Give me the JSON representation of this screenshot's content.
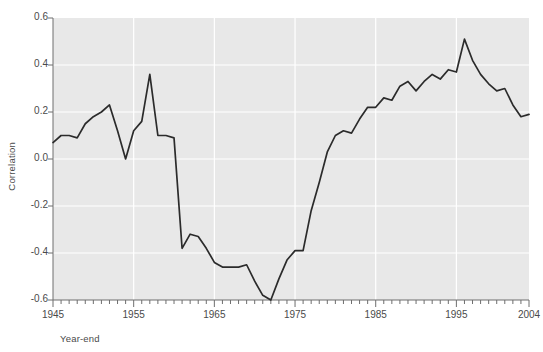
{
  "chart_data": {
    "type": "line",
    "title": "",
    "xlabel": "Year-end",
    "ylabel": "Correlation",
    "xlim": [
      1945,
      2004
    ],
    "ylim": [
      -0.6,
      0.6
    ],
    "grid": true,
    "legend": null,
    "x_tick_labels": [
      "1945",
      "1955",
      "1965",
      "1975",
      "1985",
      "1995",
      "2004"
    ],
    "x_tick_values": [
      1945,
      1955,
      1965,
      1975,
      1985,
      1995,
      2004
    ],
    "y_tick_labels": [
      "0.6",
      "0.4",
      "0.2",
      "0.0",
      "-0.2",
      "-0.4",
      "-0.6"
    ],
    "y_tick_values": [
      0.6,
      0.4,
      0.2,
      0.0,
      -0.2,
      -0.4,
      -0.6
    ],
    "x_minor_tick_step": 1,
    "line_color": "#2b2b2b",
    "plot_background": "#e8e8e8",
    "gridline_color": "#ffffff",
    "series": [
      {
        "name": "Correlation",
        "x": [
          1945,
          1946,
          1947,
          1948,
          1949,
          1950,
          1951,
          1952,
          1953,
          1954,
          1955,
          1956,
          1957,
          1958,
          1959,
          1960,
          1961,
          1962,
          1963,
          1964,
          1965,
          1966,
          1967,
          1968,
          1969,
          1970,
          1971,
          1972,
          1973,
          1974,
          1975,
          1976,
          1977,
          1978,
          1979,
          1980,
          1981,
          1982,
          1983,
          1984,
          1985,
          1986,
          1987,
          1988,
          1989,
          1990,
          1991,
          1992,
          1993,
          1994,
          1995,
          1996,
          1997,
          1998,
          1999,
          2000,
          2001,
          2002,
          2003,
          2004
        ],
        "values": [
          0.07,
          0.1,
          0.1,
          0.09,
          0.15,
          0.18,
          0.2,
          0.23,
          0.12,
          0.0,
          0.12,
          0.16,
          0.36,
          0.1,
          0.1,
          0.09,
          -0.38,
          -0.32,
          -0.33,
          -0.38,
          -0.44,
          -0.46,
          -0.46,
          -0.46,
          -0.45,
          -0.52,
          -0.58,
          -0.6,
          -0.51,
          -0.43,
          -0.39,
          -0.39,
          -0.22,
          -0.1,
          0.03,
          0.1,
          0.12,
          0.11,
          0.17,
          0.22,
          0.22,
          0.26,
          0.25,
          0.31,
          0.33,
          0.29,
          0.33,
          0.36,
          0.34,
          0.38,
          0.37,
          0.51,
          0.42,
          0.36,
          0.32,
          0.29,
          0.3,
          0.23,
          0.18,
          0.19
        ]
      }
    ]
  },
  "axes": {
    "y_title": "Correlation",
    "x_title": "Year-end"
  }
}
